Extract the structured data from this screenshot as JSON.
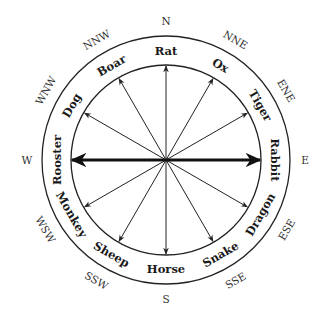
{
  "center": [
    166,
    160
  ],
  "radii": {
    "outer": 124,
    "inner": 95,
    "animal_label": 109,
    "direction_label": 139
  },
  "colors": {
    "ink": "#222222",
    "background": "#ffffff"
  },
  "animals": [
    {
      "name": "Rat",
      "angle": 0
    },
    {
      "name": "Ox",
      "angle": 30
    },
    {
      "name": "Tiger",
      "angle": 60
    },
    {
      "name": "Rabbit",
      "angle": 90
    },
    {
      "name": "Dragon",
      "angle": 120
    },
    {
      "name": "Snake",
      "angle": 150
    },
    {
      "name": "Horse",
      "angle": 180
    },
    {
      "name": "Sheep",
      "angle": 210
    },
    {
      "name": "Monkey",
      "angle": 240
    },
    {
      "name": "Rooster",
      "angle": 270
    },
    {
      "name": "Dog",
      "angle": 300
    },
    {
      "name": "Boar",
      "angle": 330
    }
  ],
  "directions": [
    {
      "name": "N",
      "angle": 0
    },
    {
      "name": "NNE",
      "angle": 30
    },
    {
      "name": "ENE",
      "angle": 60
    },
    {
      "name": "E",
      "angle": 90
    },
    {
      "name": "ESE",
      "angle": 120
    },
    {
      "name": "SSE",
      "angle": 150
    },
    {
      "name": "S",
      "angle": 180
    },
    {
      "name": "SSW",
      "angle": 210
    },
    {
      "name": "WSW",
      "angle": 240
    },
    {
      "name": "W",
      "angle": 270
    },
    {
      "name": "WNW",
      "angle": 300
    },
    {
      "name": "NNW",
      "angle": 330
    }
  ],
  "bold_axis": {
    "from_angle": 270,
    "to_angle": 90
  }
}
